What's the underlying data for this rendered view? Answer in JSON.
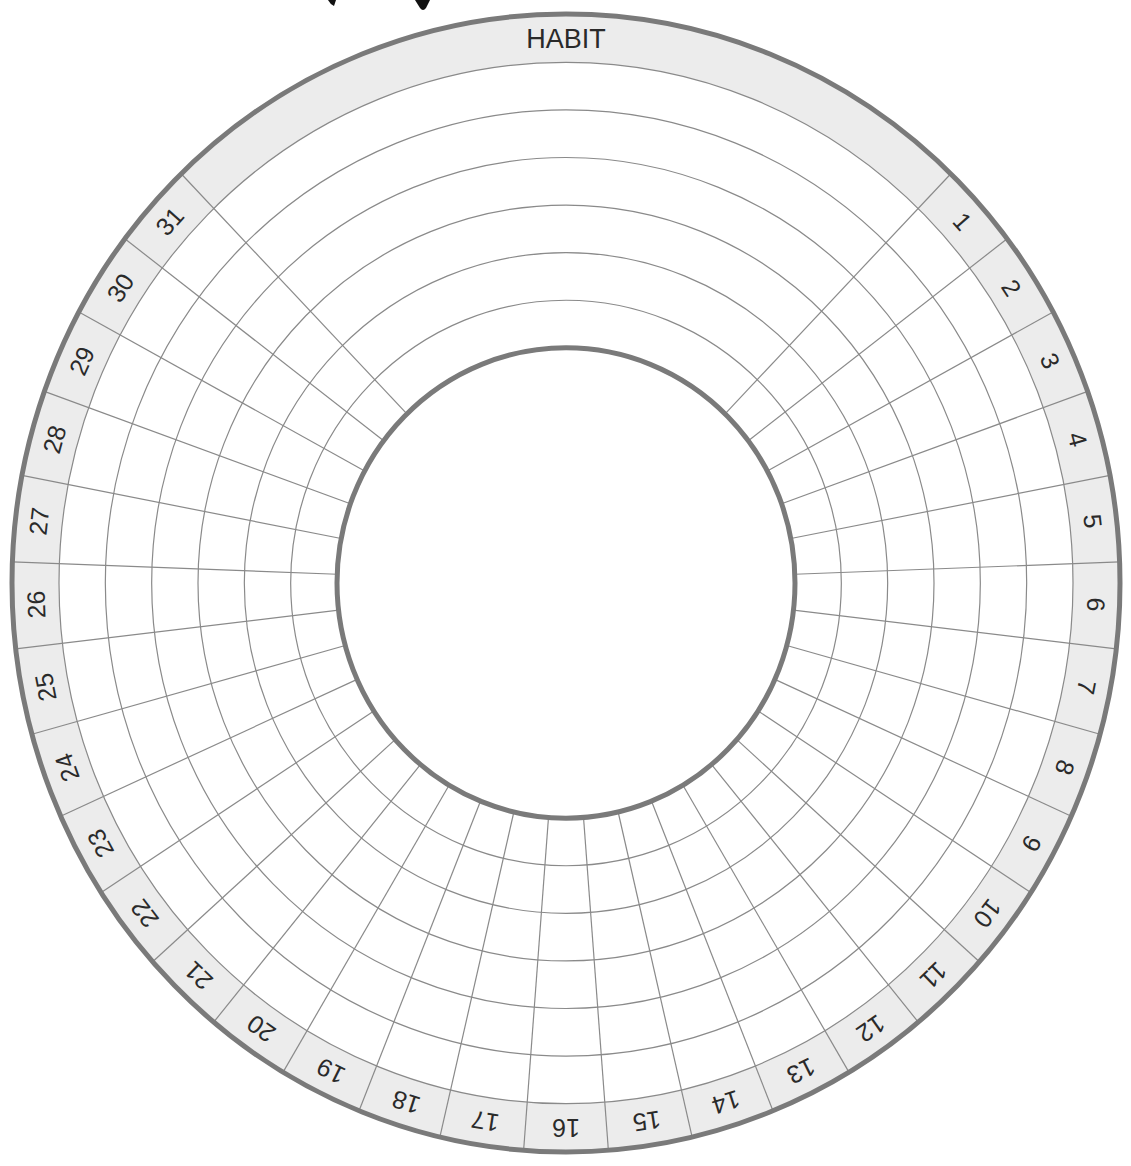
{
  "tracker": {
    "header_label": "HABIT",
    "day_labels": [
      "1",
      "2",
      "3",
      "4",
      "5",
      "6",
      "7",
      "8",
      "9",
      "10",
      "11",
      "12",
      "13",
      "14",
      "15",
      "16",
      "17",
      "18",
      "19",
      "20",
      "21",
      "22",
      "23",
      "24",
      "25",
      "26",
      "27",
      "28",
      "29",
      "30",
      "31"
    ],
    "habit_rows": 6,
    "colors": {
      "band_fill": "#ececec",
      "rim_stroke": "#7a7a7a",
      "grid_stroke": "#8a8a8a",
      "label_text": "#2a2a2a",
      "background": "#ffffff"
    }
  }
}
